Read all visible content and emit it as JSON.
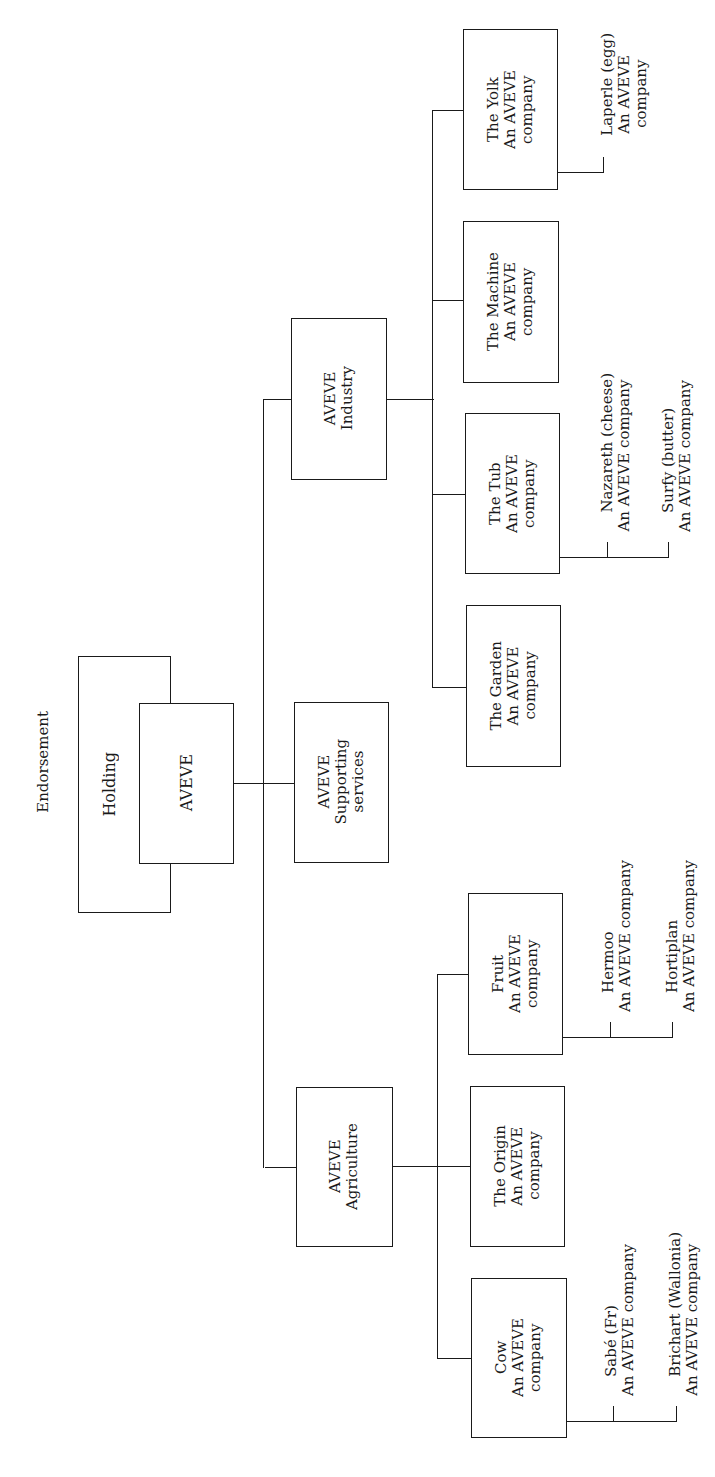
{
  "diagram": {
    "title": "Endorsement",
    "holding": {
      "label": "Holding"
    },
    "root": {
      "label": "AVEVE"
    },
    "divisions": [
      {
        "id": "industry",
        "label": "AVEVE\nIndustry",
        "children": [
          {
            "id": "garden",
            "label": "The Garden\nAn AVEVE\ncompany",
            "subsidiaries": []
          },
          {
            "id": "tub",
            "label": "The Tub\nAn AVEVE\ncompany",
            "subsidiaries": [
              {
                "name": "Nazareth (cheese)",
                "endorsement": "An AVEVE company"
              },
              {
                "name": "Surfy (butter)",
                "endorsement": "An AVEVE company"
              }
            ]
          },
          {
            "id": "machine",
            "label": "The Machine\nAn AVEVE\ncompany",
            "subsidiaries": []
          },
          {
            "id": "yolk",
            "label": "The Yolk\nAn AVEVE\ncompany",
            "subsidiaries": [
              {
                "name": "Laperle (egg)",
                "endorsement": "An AVEVE\ncompany"
              }
            ]
          }
        ]
      },
      {
        "id": "supporting",
        "label": "AVEVE\nSupporting\nservices",
        "children": []
      },
      {
        "id": "agriculture",
        "label": "AVEVE\nAgriculture",
        "children": [
          {
            "id": "fruit",
            "label": "Fruit\nAn AVEVE\ncompany",
            "subsidiaries": [
              {
                "name": "Hermoo",
                "endorsement": "An AVEVE company"
              },
              {
                "name": "Hortiplan",
                "endorsement": "An AVEVE company"
              }
            ]
          },
          {
            "id": "origin",
            "label": "The Origin\nAn AVEVE\ncompany",
            "subsidiaries": []
          },
          {
            "id": "cow",
            "label": "Cow\nAn AVEVE\ncompany",
            "subsidiaries": [
              {
                "name": "Sabé (Fr)",
                "endorsement": "An AVEVE company"
              },
              {
                "name": "Brichart (Wallonia)",
                "endorsement": "An AVEVE company"
              }
            ]
          }
        ]
      }
    ]
  },
  "colors": {
    "line": "#1a1a1a",
    "background": "#ffffff"
  }
}
